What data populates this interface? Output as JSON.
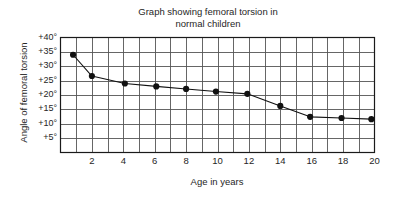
{
  "chart_data": {
    "type": "line",
    "title": "Graph showing femoral torsion in\nnormal children",
    "xlabel": "Age in years",
    "ylabel": "Angle of femoral torsion",
    "xlim": [
      0,
      20
    ],
    "ylim": [
      0,
      40
    ],
    "grid": true,
    "legend": "none",
    "x_ticks": [
      {
        "value": 2,
        "label": "2"
      },
      {
        "value": 4,
        "label": "4"
      },
      {
        "value": 6,
        "label": "6"
      },
      {
        "value": 8,
        "label": "8"
      },
      {
        "value": 10,
        "label": "10"
      },
      {
        "value": 12,
        "label": "12"
      },
      {
        "value": 14,
        "label": "14"
      },
      {
        "value": 16,
        "label": "16"
      },
      {
        "value": 18,
        "label": "18"
      },
      {
        "value": 20,
        "label": "20"
      }
    ],
    "y_ticks": [
      {
        "value": 40,
        "label": "+40°"
      },
      {
        "value": 35,
        "label": "+35°"
      },
      {
        "value": 30,
        "label": "+30°"
      },
      {
        "value": 25,
        "label": "+25°"
      },
      {
        "value": 20,
        "label": "+20°"
      },
      {
        "value": 15,
        "label": "+15°"
      },
      {
        "value": 10,
        "label": "+10°"
      },
      {
        "value": 5,
        "label": "+5°"
      }
    ],
    "x_gridline_step": 1,
    "y_gridline_step": 5,
    "series": [
      {
        "name": "Mean femoral torsion",
        "marker": "filled-circle",
        "color": "#111111",
        "x": [
          0.8,
          2.0,
          4.1,
          6.1,
          8.0,
          9.9,
          11.9,
          14.0,
          15.9,
          17.9,
          19.8
        ],
        "y": [
          34.0,
          26.6,
          24.0,
          23.0,
          22.1,
          21.2,
          20.4,
          16.2,
          12.4,
          12.0,
          11.6
        ]
      }
    ]
  },
  "colors": {
    "background": "#ffffff",
    "axis": "#1a1a1a",
    "grid": "#555555",
    "series": "#111111",
    "text": "#262626"
  }
}
